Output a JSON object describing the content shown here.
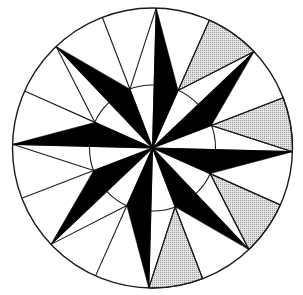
{
  "figure": {
    "points": 8,
    "spikes": [
      {
        "name": "N",
        "direction_deg": -88.5
      },
      {
        "name": "NE",
        "direction_deg": -43.5
      },
      {
        "name": "E",
        "direction_deg": 1.5
      },
      {
        "name": "SE",
        "direction_deg": 46.5
      },
      {
        "name": "S",
        "direction_deg": 91.5
      },
      {
        "name": "SW",
        "direction_deg": 136.5
      },
      {
        "name": "W",
        "direction_deg": 181.5
      },
      {
        "name": "NW",
        "direction_deg": 226.5
      }
    ],
    "shaded_sectors": [
      0,
      1,
      2,
      3
    ],
    "colors": {
      "spike_fill": "#000000",
      "line": "#1a1a1a",
      "shade": "#c8c8c8",
      "background": "#ffffff"
    }
  }
}
